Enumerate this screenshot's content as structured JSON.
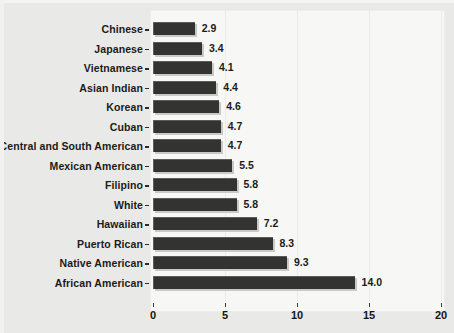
{
  "chart_data": {
    "type": "bar",
    "orientation": "horizontal",
    "title": "",
    "subtitle": "",
    "xlabel": "",
    "ylabel": "",
    "xlim": [
      0,
      20
    ],
    "xticks": [
      "0",
      "5",
      "10",
      "15",
      "20"
    ],
    "xtick_values": [
      0,
      5,
      10,
      15,
      20
    ],
    "grid": true,
    "legend": null,
    "categories": [
      "Chinese",
      "Japanese",
      "Vietnamese",
      "Asian Indian",
      "Korean",
      "Cuban",
      "Central and South American",
      "Mexican American",
      "Filipino",
      "White",
      "Hawaiian",
      "Puerto Rican",
      "Native American",
      "African American"
    ],
    "values": [
      2.9,
      3.4,
      4.1,
      4.4,
      4.6,
      4.7,
      4.7,
      5.5,
      5.8,
      5.8,
      7.2,
      8.3,
      9.3,
      14.0
    ],
    "value_labels": [
      "2.9",
      "3.4",
      "4.1",
      "4.4",
      "4.6",
      "4.7",
      "4.7",
      "5.5",
      "5.8",
      "5.8",
      "7.2",
      "8.3",
      "9.3",
      "14.0"
    ],
    "bar_color": "#333331",
    "panel_color": "#f7f7f5",
    "background_color": "#e9e9e7"
  }
}
